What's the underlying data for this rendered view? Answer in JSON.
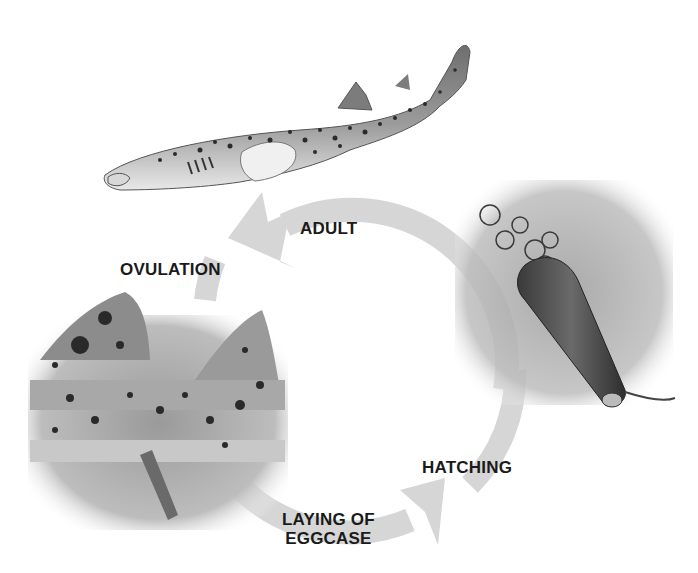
{
  "diagram": {
    "type": "life-cycle",
    "stages": [
      {
        "id": "adult",
        "label": "ADULT"
      },
      {
        "id": "ovulation",
        "label": "OVULATION"
      },
      {
        "id": "laying",
        "label": "LAYING OF\nEGGCASE",
        "line1": "LAYING OF",
        "line2": "EGGCASE"
      },
      {
        "id": "hatching",
        "label": "HATCHING"
      }
    ],
    "colors": {
      "arrow": "#d6d6d6",
      "text": "#1a1a1a",
      "shark_body": "#8a8a8a",
      "shark_belly": "#e4e4e4",
      "spots": "#2b2b2b",
      "panel_bg": "#bdbdbd"
    }
  }
}
